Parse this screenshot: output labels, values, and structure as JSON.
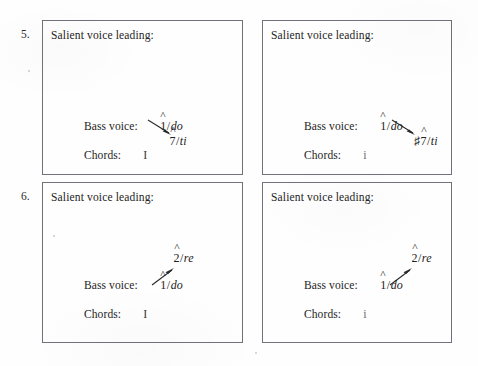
{
  "page": {
    "background_color": "#fefefe",
    "ink_color": "#242424",
    "border_color": "#6f7278"
  },
  "exercises": [
    {
      "number": "5.",
      "panels": [
        {
          "position": "left",
          "heading": "Salient voice leading:",
          "bass_voice_label": "Bass voice:",
          "chords_label": "Chords:",
          "start_degree": {
            "accidental": "",
            "numeral": "1",
            "slash": "/",
            "solfege": "do"
          },
          "target_degree": {
            "accidental": "",
            "numeral": "7",
            "slash": "/",
            "solfege": "ti"
          },
          "arrow_direction": "down",
          "chord_symbol": "I",
          "chord_quality": "major"
        },
        {
          "position": "right",
          "heading": "Salient voice leading:",
          "bass_voice_label": "Bass voice:",
          "chords_label": "Chords:",
          "start_degree": {
            "accidental": "",
            "numeral": "1",
            "slash": "/",
            "solfege": "do"
          },
          "target_degree": {
            "accidental": "♯",
            "numeral": "7",
            "slash": "/",
            "solfege": "ti"
          },
          "arrow_direction": "down",
          "chord_symbol": "i",
          "chord_quality": "minor"
        }
      ]
    },
    {
      "number": "6.",
      "panels": [
        {
          "position": "left",
          "heading": "Salient voice leading:",
          "bass_voice_label": "Bass voice:",
          "chords_label": "Chords:",
          "start_degree": {
            "accidental": "",
            "numeral": "1",
            "slash": "/",
            "solfege": "do"
          },
          "target_degree": {
            "accidental": "",
            "numeral": "2",
            "slash": "/",
            "solfege": "re"
          },
          "arrow_direction": "up",
          "chord_symbol": "I",
          "chord_quality": "major"
        },
        {
          "position": "right",
          "heading": "Salient voice leading:",
          "bass_voice_label": "Bass voice:",
          "chords_label": "Chords:",
          "start_degree": {
            "accidental": "",
            "numeral": "1",
            "slash": "/",
            "solfege": "do"
          },
          "target_degree": {
            "accidental": "",
            "numeral": "2",
            "slash": "/",
            "solfege": "re"
          },
          "arrow_direction": "up",
          "chord_symbol": "i",
          "chord_quality": "minor"
        }
      ]
    }
  ]
}
